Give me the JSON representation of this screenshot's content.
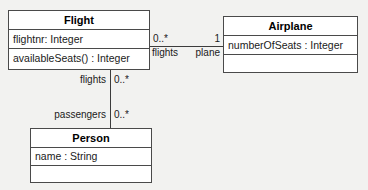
{
  "diagram": {
    "type": "uml-class-diagram",
    "background_color": "#f2f2f0",
    "line_color": "#3c3c3c",
    "box_fill": "#ffffff",
    "box_border": "#4a4a4a",
    "classes": [
      {
        "id": "flight",
        "name": "Flight",
        "attributes": [
          "flightnr: Integer"
        ],
        "operations": [
          "availableSeats() : Integer"
        ],
        "empty_compartment": false
      },
      {
        "id": "airplane",
        "name": "Airplane",
        "attributes": [
          "numberOfSeats : Integer"
        ],
        "operations": [],
        "empty_compartment": true
      },
      {
        "id": "person",
        "name": "Person",
        "attributes": [
          "name : String"
        ],
        "operations": [],
        "empty_compartment": true
      }
    ],
    "associations": [
      {
        "id": "flight-airplane",
        "from": "Flight",
        "to": "Airplane",
        "source_multiplicity": "0..*",
        "source_role": "flights",
        "target_multiplicity": "1",
        "target_role": "plane"
      },
      {
        "id": "flight-person",
        "from": "Flight",
        "to": "Person",
        "source_multiplicity": "0..*",
        "source_role": "flights",
        "target_multiplicity": "0..*",
        "target_role": "passengers"
      }
    ]
  }
}
